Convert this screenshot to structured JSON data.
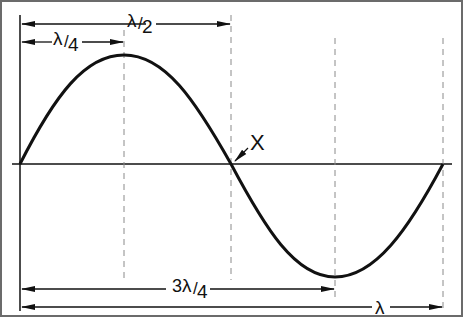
{
  "diagram": {
    "labels": {
      "half_wavelength": "λ/2",
      "quarter_wavelength": "λ/4",
      "three_quarter_wavelength": "3λ/4",
      "wavelength": "λ",
      "point_x": "X"
    },
    "label_parts": {
      "lambda": "λ",
      "half_den": "2",
      "quarter_den": "4",
      "three": "3",
      "slash": "/"
    },
    "colors": {
      "border": "#6b6b6b",
      "line": "#111111",
      "dashed": "#8a8a8a",
      "background": "#ffffff"
    },
    "markers": [
      {
        "name": "quarter",
        "position": "λ/4"
      },
      {
        "name": "half",
        "position": "λ/2"
      },
      {
        "name": "three-quarter",
        "position": "3λ/4"
      },
      {
        "name": "full",
        "position": "λ"
      }
    ]
  }
}
